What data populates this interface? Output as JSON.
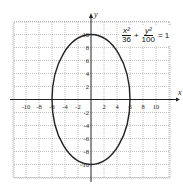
{
  "diagram": {
    "type": "ellipse-graph",
    "equation": {
      "term1": {
        "numerator": "x²",
        "denominator": "36"
      },
      "plus": "+",
      "term2": {
        "numerator": "y²",
        "denominator": "100"
      },
      "equals": "= 1"
    },
    "axes": {
      "x_label": "x",
      "y_label": "y",
      "x_ticks": [
        "-10",
        "-8",
        "-6",
        "-4",
        "-2",
        "2",
        "4",
        "6",
        "8",
        "10"
      ],
      "y_ticks": [
        "10",
        "8",
        "6",
        "4",
        "2",
        "-2",
        "-4",
        "-6",
        "-8",
        "-10"
      ],
      "range": [
        -12,
        12
      ],
      "grid": true,
      "grid_step": 2
    },
    "ellipse": {
      "center": [
        0,
        0
      ],
      "semi_axis_x": 6,
      "semi_axis_y": 10,
      "color": "#222222"
    }
  }
}
